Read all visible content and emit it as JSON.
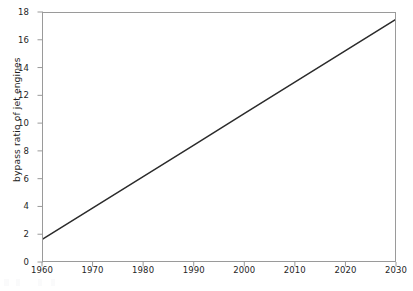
{
  "figure": {
    "background_color": "#ffffff",
    "frame_color": "#9a9a9a",
    "artifact_label": ""
  },
  "chart_data": {
    "type": "line",
    "title": "",
    "subtitle": "",
    "xlabel": "",
    "ylabel": "bypass ratio of jet engines",
    "xlim": [
      1960,
      2030
    ],
    "ylim": [
      0,
      18
    ],
    "xticks": [
      1960,
      1970,
      1980,
      1990,
      2000,
      2010,
      2020,
      2030
    ],
    "xtick_labels": [
      "1960",
      "1970",
      "1980",
      "1990",
      "2000",
      "2010",
      "2020",
      "2030"
    ],
    "yticks": [
      0,
      2,
      4,
      6,
      8,
      10,
      12,
      14,
      16,
      18
    ],
    "ytick_labels": [
      "0",
      "2",
      "4",
      "6",
      "8",
      "10",
      "12",
      "14",
      "16",
      "18"
    ],
    "grid": false,
    "legend": null,
    "legend_position": "none",
    "annotations": [],
    "series": [
      {
        "name": "bypass ratio of jet engines",
        "color": "#2b2b2b",
        "line_width": 1.5,
        "style": "solid",
        "markers": "none",
        "x": [
          1960,
          1970,
          1980,
          1990,
          2000,
          2010,
          2020,
          2030
        ],
        "values": [
          1.6,
          3.87,
          6.14,
          8.41,
          10.69,
          12.96,
          15.23,
          17.5
        ]
      }
    ]
  }
}
